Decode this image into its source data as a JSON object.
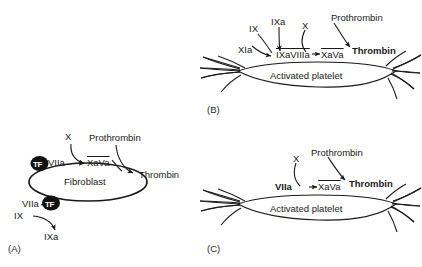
{
  "figure": {
    "background": "#ffffff",
    "stroke_color": "#1a1a1a",
    "text_color": "#1a1a1a"
  },
  "panels": [
    {
      "id": "A",
      "label": "(A)",
      "cell_name": "Fibroblast",
      "cell_shape": "ellipse",
      "complex_markers": [
        {
          "name": "tf-marker-upper",
          "text": "TF"
        },
        {
          "name": "tf-marker-lower",
          "text": "TF"
        }
      ],
      "labels": [
        {
          "name": "factor-x-label",
          "text": "X",
          "bold": false,
          "overline": false
        },
        {
          "name": "prothrombin-label",
          "text": "Prothrombin",
          "bold": false,
          "overline": false
        },
        {
          "name": "viia-upper-label",
          "text": "VIIa",
          "bold": false,
          "overline": false
        },
        {
          "name": "xava-label",
          "text": "XaVa",
          "bold": false,
          "overline": true
        },
        {
          "name": "thrombin-label",
          "text": "Thrombin",
          "bold": false,
          "overline": false
        },
        {
          "name": "viia-lower-label",
          "text": "VIIa",
          "bold": false,
          "overline": false
        },
        {
          "name": "factor-ix-label",
          "text": "IX",
          "bold": false,
          "overline": false
        },
        {
          "name": "factor-ixa-label",
          "text": "IXa",
          "bold": false,
          "overline": false
        }
      ]
    },
    {
      "id": "B",
      "label": "(B)",
      "cell_name": "Activated platelet",
      "cell_shape": "platelet",
      "labels": [
        {
          "name": "factor-ixa-top-label",
          "text": "IXa",
          "bold": false,
          "overline": false
        },
        {
          "name": "factor-ix-label",
          "text": "IX",
          "bold": false,
          "overline": false
        },
        {
          "name": "factor-x-label",
          "text": "X",
          "bold": false,
          "overline": false
        },
        {
          "name": "prothrombin-label",
          "text": "Prothrombin",
          "bold": false,
          "overline": false
        },
        {
          "name": "factor-xia-label",
          "text": "XIa",
          "bold": false,
          "overline": false
        },
        {
          "name": "ixaviiia-label",
          "text": "IXaVIIIa",
          "bold": false,
          "overline": true
        },
        {
          "name": "xava-label",
          "text": "XaVa",
          "bold": false,
          "overline": true
        },
        {
          "name": "thrombin-label",
          "text": "Thrombin",
          "bold": true,
          "overline": false
        }
      ]
    },
    {
      "id": "C",
      "label": "(C)",
      "cell_name": "Activated platelet",
      "cell_shape": "platelet",
      "labels": [
        {
          "name": "factor-x-label",
          "text": "X",
          "bold": false,
          "overline": false
        },
        {
          "name": "prothrombin-label",
          "text": "Prothrombin",
          "bold": false,
          "overline": false
        },
        {
          "name": "viia-label",
          "text": "VIIa",
          "bold": true,
          "overline": false
        },
        {
          "name": "xava-label",
          "text": "XaVa",
          "bold": false,
          "overline": true
        },
        {
          "name": "thrombin-label",
          "text": "Thrombin",
          "bold": true,
          "overline": false
        }
      ]
    }
  ]
}
